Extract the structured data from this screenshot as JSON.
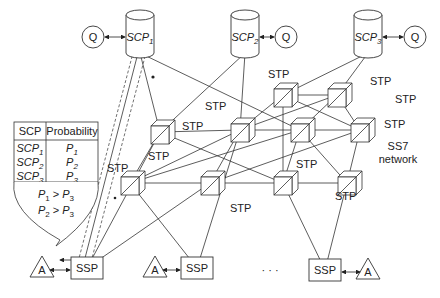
{
  "diagram": {
    "scp_nodes": [
      {
        "id": "scp1",
        "label": "SCP",
        "sub": "1",
        "query_label": "Q",
        "query_side": "left"
      },
      {
        "id": "scp2",
        "label": "SCP",
        "sub": "2",
        "query_label": "Q",
        "query_side": "right"
      },
      {
        "id": "scp3",
        "label": "SCP",
        "sub": "3",
        "query_label": "Q",
        "query_side": "right"
      }
    ],
    "stp_label": "STP",
    "network_label_line1": "SS7",
    "network_label_line2": "network",
    "ssp_nodes": [
      {
        "id": "ssp1",
        "label": "SSP",
        "agent_label": "A",
        "agent_side": "left"
      },
      {
        "id": "ssp2",
        "label": "SSP",
        "agent_label": "A",
        "agent_side": "left"
      },
      {
        "id": "ssp3",
        "label": "SSP",
        "agent_label": "A",
        "agent_side": "right"
      }
    ],
    "ellipsis": "· · ·",
    "table": {
      "headers": [
        "SCP",
        "Probability"
      ],
      "rows": [
        {
          "scp": "SCP",
          "scp_sub": "1",
          "p": "P",
          "p_sub": "1"
        },
        {
          "scp": "SCP",
          "scp_sub": "2",
          "p": "P",
          "p_sub": "2"
        },
        {
          "scp": "SCP",
          "scp_sub": "3",
          "p": "P",
          "p_sub": "3"
        }
      ],
      "constraints": [
        {
          "a": "P",
          "a_sub": "1",
          "op": ">",
          "b": "P",
          "b_sub": "3"
        },
        {
          "a": "P",
          "a_sub": "2",
          "op": ">",
          "b": "P",
          "b_sub": "3"
        }
      ]
    }
  }
}
